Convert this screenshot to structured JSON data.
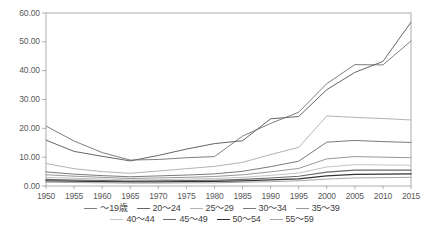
{
  "chart_data": {
    "type": "line",
    "title": "",
    "subtitle": "",
    "xlabel": "",
    "ylabel": "",
    "xlim": [
      1950,
      2015
    ],
    "ylim": [
      0,
      60
    ],
    "grid": false,
    "legend_position": "bottom",
    "x": [
      1950,
      1955,
      1960,
      1965,
      1970,
      1975,
      1980,
      1985,
      1990,
      1995,
      2000,
      2005,
      2010,
      2015
    ],
    "x_tick_labels": [
      "1950",
      "1955",
      "1960",
      "1965",
      "1970",
      "1975",
      "1980",
      "1985",
      "1990",
      "1995",
      "2000",
      "2005",
      "2010",
      "2015"
    ],
    "y_ticks": [
      0,
      10,
      20,
      30,
      40,
      50,
      60
    ],
    "y_tick_labels": [
      "0.00",
      "10.00",
      "20.00",
      "30.00",
      "40.00",
      "50.00",
      "60.00"
    ],
    "series": [
      {
        "name": "～19歳",
        "color": "#808080",
        "width": 1.0,
        "values": [
          20.8,
          15.6,
          11.6,
          9.0,
          9.2,
          9.8,
          10.2,
          17.3,
          21.7,
          25.6,
          35.5,
          42.1,
          42.0,
          50.3
        ]
      },
      {
        "name": "20～24",
        "color": "#666666",
        "width": 1.0,
        "values": [
          15.9,
          12.0,
          10.3,
          8.7,
          10.6,
          12.8,
          14.7,
          15.7,
          23.3,
          24.1,
          33.4,
          39.4,
          43.2,
          56.8
        ]
      },
      {
        "name": "25～29",
        "color": "#b3b3b3",
        "width": 1.0,
        "values": [
          7.8,
          6.0,
          5.0,
          4.4,
          5.2,
          6.0,
          6.8,
          8.2,
          10.9,
          13.4,
          24.3,
          23.8,
          23.4,
          22.9
        ]
      },
      {
        "name": "30～34",
        "color": "#7a7a7a",
        "width": 1.0,
        "values": [
          4.9,
          4.1,
          3.6,
          3.2,
          3.5,
          3.8,
          4.2,
          5.1,
          6.7,
          8.6,
          15.2,
          15.8,
          15.4,
          15.1
        ]
      },
      {
        "name": "35～39",
        "color": "#999999",
        "width": 1.0,
        "values": [
          3.9,
          3.4,
          3.0,
          2.6,
          2.8,
          3.0,
          3.3,
          3.9,
          4.9,
          6.1,
          9.4,
          10.2,
          10.0,
          9.8
        ]
      },
      {
        "name": "40～44",
        "color": "#c4c4c4",
        "width": 1.0,
        "values": [
          3.0,
          2.7,
          2.4,
          2.1,
          2.2,
          2.4,
          2.6,
          3.0,
          3.7,
          4.5,
          6.6,
          7.4,
          7.3,
          7.2
        ]
      },
      {
        "name": "45～49",
        "color": "#6b6b6b",
        "width": 1.1,
        "values": [
          2.3,
          2.1,
          1.9,
          1.7,
          1.8,
          1.9,
          2.0,
          2.3,
          2.8,
          3.4,
          4.8,
          5.5,
          5.5,
          5.5
        ]
      },
      {
        "name": "50～54",
        "color": "#333333",
        "width": 1.3,
        "values": [
          1.8,
          1.7,
          1.5,
          1.4,
          1.4,
          1.5,
          1.6,
          1.8,
          2.1,
          2.5,
          3.5,
          4.0,
          4.1,
          4.2
        ]
      },
      {
        "name": "55～59",
        "color": "#a8a8a8",
        "width": 1.0,
        "values": [
          1.3,
          1.2,
          1.1,
          1.0,
          1.0,
          1.1,
          1.1,
          1.3,
          1.5,
          1.8,
          2.4,
          2.8,
          2.9,
          3.0
        ]
      }
    ],
    "axis_color": "#9a9a9a",
    "plot_bg": "#ffffff"
  },
  "legend": {
    "rows": [
      [
        "～19歳",
        "20～24",
        "25～29",
        "30～34",
        "35～39"
      ],
      [
        "40～44",
        "45～49",
        "50～54",
        "55～59"
      ]
    ]
  }
}
